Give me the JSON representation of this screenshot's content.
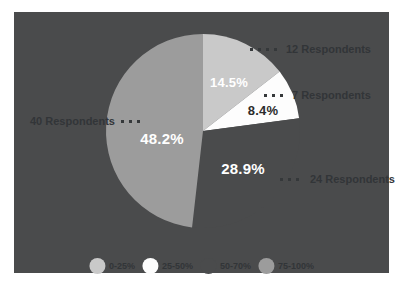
{
  "colors": {
    "page_bg": "#ffffff",
    "panel_bg": "#4a4b4c",
    "callout_text": "#323538",
    "percent_label_light": "#ffffff",
    "percent_label_dark": "#2c2c2c"
  },
  "chart_data": {
    "type": "pie",
    "title": "",
    "direction": "clockwise",
    "start_angle_deg": 0,
    "legend_position": "bottom",
    "total_respondents": 83,
    "slices": [
      {
        "category": "0-25%",
        "respondents": 12,
        "percent": 14.5,
        "percent_label": "14.5%",
        "callout": "12 Respondents",
        "color": "#c9c9c9"
      },
      {
        "category": "25-50%",
        "respondents": 7,
        "percent": 8.4,
        "percent_label": "8.4%",
        "callout": "7 Respondents",
        "color": "#fdfdfd"
      },
      {
        "category": "50-70%",
        "respondents": 24,
        "percent": 28.9,
        "percent_label": "28.9%",
        "callout": "24 Respondents",
        "color": "#4a4b4c"
      },
      {
        "category": "75-100%",
        "respondents": 40,
        "percent": 48.2,
        "percent_label": "48.2%",
        "callout": "40 Respondents",
        "color": "#9c9c9c"
      }
    ],
    "legend": [
      {
        "label": "0-25%",
        "color": "#c9c9c9"
      },
      {
        "label": "25-50%",
        "color": "#fdfdfd"
      },
      {
        "label": "50-70%",
        "color": "#4a4b4c"
      },
      {
        "label": "75-100%",
        "color": "#9c9c9c"
      }
    ]
  }
}
